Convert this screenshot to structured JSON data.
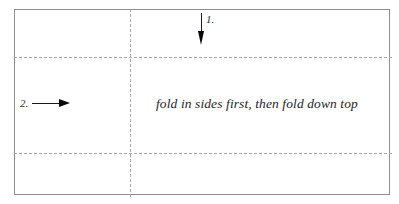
{
  "diagram": {
    "type": "paper-folding-instruction",
    "caption": "fold in sides first, then fold down top",
    "steps": [
      {
        "number": "1.",
        "direction": "down",
        "description": "fold down top"
      },
      {
        "number": "2.",
        "direction": "right",
        "description": "fold in sides"
      }
    ],
    "colors": {
      "outline": "#8e8e8e",
      "fold_line": "#a8a8a8",
      "arrow": "#0a0a0a",
      "text": "#1e1e1e",
      "background": "#ffffff"
    }
  }
}
